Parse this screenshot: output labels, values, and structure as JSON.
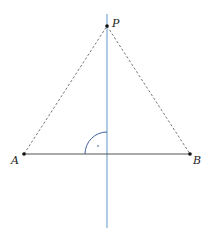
{
  "figure": {
    "points": [
      {
        "id": "P",
        "label": "P"
      },
      {
        "id": "A",
        "label": "A"
      },
      {
        "id": "B",
        "label": "B"
      }
    ],
    "segments": [
      {
        "from": "A",
        "to": "B",
        "style": "solid"
      },
      {
        "from": "A",
        "to": "P",
        "style": "dashed"
      },
      {
        "from": "P",
        "to": "B",
        "style": "dashed"
      }
    ],
    "perpendicular_bisector": {
      "description": "vertical line through P perpendicular to AB"
    },
    "right_angle_mark": {
      "description": "arc with dot marking 90° angle between AB and bisector"
    },
    "colors": {
      "segment": "#444444",
      "dashed": "#555555",
      "bisector": "#8fb4d6",
      "arc": "#2f4f8f",
      "point": "#111111"
    }
  }
}
